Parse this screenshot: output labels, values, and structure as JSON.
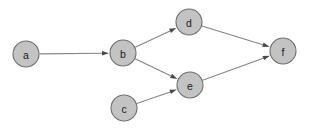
{
  "diagram": {
    "type": "directed-graph",
    "title": "",
    "background_color": "#ffffff",
    "node_fill_color": "#c3c3c3",
    "node_stroke_color": "#6e6e6e",
    "edge_color": "#848484",
    "arrowhead_color": "#4a4a4a",
    "label_color": "#1a1a1a",
    "nodes": [
      {
        "id": "a",
        "label": "a",
        "cx": 26,
        "cy": 54,
        "r": 13
      },
      {
        "id": "b",
        "label": "b",
        "cx": 123,
        "cy": 53,
        "r": 13
      },
      {
        "id": "c",
        "label": "c",
        "cx": 124,
        "cy": 108,
        "r": 13
      },
      {
        "id": "d",
        "label": "d",
        "cx": 189,
        "cy": 22,
        "r": 13
      },
      {
        "id": "e",
        "label": "e",
        "cx": 190,
        "cy": 85,
        "r": 13
      },
      {
        "id": "f",
        "label": "f",
        "cx": 283,
        "cy": 51,
        "r": 13
      }
    ],
    "edges": [
      {
        "from": "a",
        "to": "b",
        "label": ""
      },
      {
        "from": "b",
        "to": "d",
        "label": ""
      },
      {
        "from": "b",
        "to": "e",
        "label": ""
      },
      {
        "from": "c",
        "to": "e",
        "label": ""
      },
      {
        "from": "d",
        "to": "f",
        "label": ""
      },
      {
        "from": "e",
        "to": "f",
        "label": ""
      }
    ]
  }
}
